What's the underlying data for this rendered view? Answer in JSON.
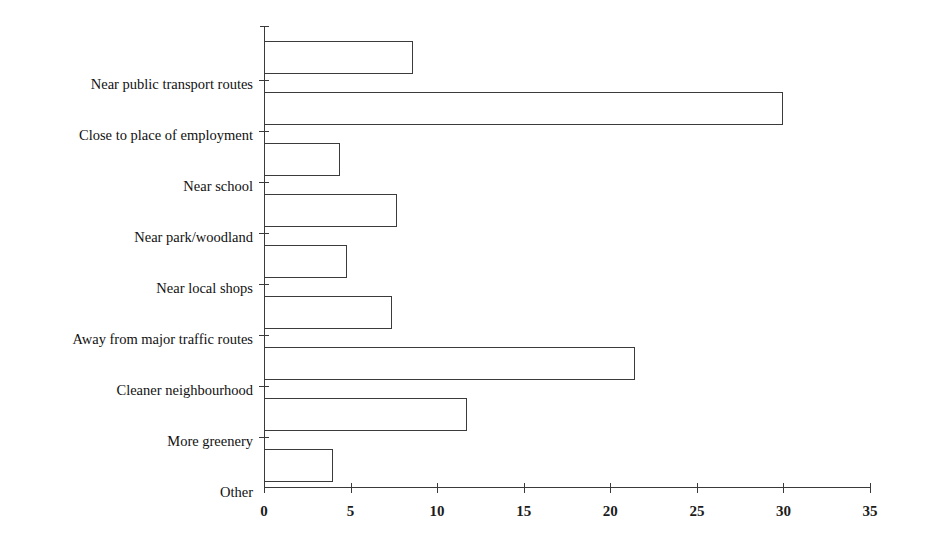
{
  "chart_data": {
    "type": "bar",
    "orientation": "horizontal",
    "title": "",
    "subtitle": "",
    "xlabel": "",
    "ylabel": "",
    "xlim": [
      0,
      35
    ],
    "ylim": null,
    "grid": false,
    "legend": null,
    "legend_position": "none",
    "xticks": [
      0,
      5,
      10,
      15,
      20,
      25,
      30,
      35
    ],
    "xtick_labels": [
      "0",
      "5",
      "10",
      "15",
      "20",
      "25",
      "30",
      "35"
    ],
    "categories": [
      "Near public transport routes",
      "Close to place of employment",
      "Near school",
      "Near park/woodland",
      "Near local shops",
      "Away from major traffic routes",
      "Cleaner neighbourhood",
      "More greenery",
      "Other"
    ],
    "values": [
      8.6,
      30.0,
      4.4,
      7.7,
      4.8,
      7.4,
      21.4,
      11.7,
      4.0
    ],
    "series": [
      {
        "name": "",
        "values": [
          8.6,
          30.0,
          4.4,
          7.7,
          4.8,
          7.4,
          21.4,
          11.7,
          4.0
        ]
      }
    ],
    "bar_fill_color": "#ffffff",
    "bar_edge_color": "#3b3b3b",
    "axis_color": "#3a3a3a",
    "background_color": "#ffffff",
    "annotations": []
  }
}
